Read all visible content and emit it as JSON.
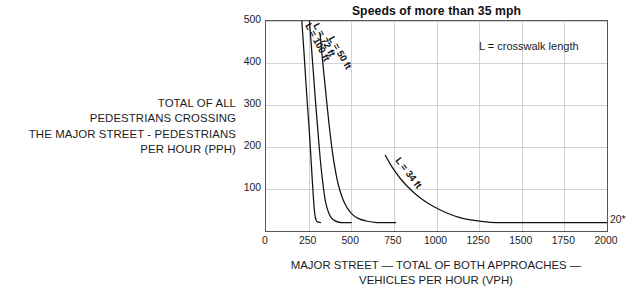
{
  "chart_data": {
    "type": "line",
    "title": "Speeds of more than 35 mph",
    "xlabel_lines": [
      "MAJOR STREET — TOTAL OF BOTH APPROACHES —",
      "VEHICLES PER HOUR (VPH)"
    ],
    "ylabel_lines": [
      "TOTAL OF ALL",
      "PEDESTRIANS CROSSING",
      "THE MAJOR STREET - PEDESTRIANS",
      "PER HOUR (PPH)"
    ],
    "annotation": "L = crosswalk length",
    "floor_annotation": "20*",
    "grid": true,
    "legend_position": "inline-curve-labels",
    "xlim": [
      0,
      2000
    ],
    "ylim": [
      0,
      500
    ],
    "xticks": [
      0,
      250,
      500,
      750,
      1000,
      1250,
      1500,
      1750,
      2000
    ],
    "yticks": [
      100,
      200,
      300,
      400,
      500
    ],
    "line_color": "#111111",
    "grid_color": "#d2d2d2",
    "axis_color": "#575757",
    "floor_value": 20,
    "series": [
      {
        "name": "L = 100 ft",
        "label_angle_deg": 62,
        "label_x": 276,
        "label_y": 500,
        "points": [
          [
            210,
            500
          ],
          [
            222,
            430
          ],
          [
            233,
            360
          ],
          [
            243,
            300
          ],
          [
            252,
            250
          ],
          [
            259,
            205
          ],
          [
            265,
            165
          ],
          [
            270,
            130
          ],
          [
            274,
            105
          ],
          [
            277,
            85
          ],
          [
            280,
            68
          ],
          [
            283,
            52
          ],
          [
            287,
            38
          ],
          [
            292,
            28
          ],
          [
            300,
            22
          ],
          [
            320,
            20
          ]
        ]
      },
      {
        "name": "L = 72 ft",
        "label_angle_deg": 62,
        "label_x": 322,
        "label_y": 500,
        "points": [
          [
            255,
            500
          ],
          [
            268,
            430
          ],
          [
            280,
            365
          ],
          [
            291,
            305
          ],
          [
            301,
            255
          ],
          [
            310,
            210
          ],
          [
            318,
            172
          ],
          [
            326,
            140
          ],
          [
            333,
            115
          ],
          [
            340,
            93
          ],
          [
            347,
            74
          ],
          [
            356,
            58
          ],
          [
            367,
            44
          ],
          [
            382,
            32
          ],
          [
            405,
            24
          ],
          [
            440,
            20
          ],
          [
            500,
            20
          ]
        ]
      },
      {
        "name": "L = 50 ft",
        "label_angle_deg": 60,
        "label_x": 410,
        "label_y": 470,
        "points": [
          [
            317,
            470
          ],
          [
            331,
            410
          ],
          [
            345,
            352
          ],
          [
            358,
            300
          ],
          [
            370,
            253
          ],
          [
            382,
            212
          ],
          [
            394,
            176
          ],
          [
            406,
            146
          ],
          [
            418,
            121
          ],
          [
            431,
            100
          ],
          [
            446,
            81
          ],
          [
            463,
            65
          ],
          [
            483,
            51
          ],
          [
            508,
            39
          ],
          [
            540,
            30
          ],
          [
            585,
            24
          ],
          [
            650,
            20
          ],
          [
            760,
            20
          ]
        ]
      },
      {
        "name": "L = 34 ft",
        "label_angle_deg": 52,
        "label_x": 800,
        "label_y": 180,
        "points": [
          [
            700,
            180
          ],
          [
            728,
            160
          ],
          [
            757,
            142
          ],
          [
            788,
            125
          ],
          [
            820,
            110
          ],
          [
            855,
            96
          ],
          [
            892,
            83
          ],
          [
            932,
            71
          ],
          [
            975,
            60
          ],
          [
            1022,
            50
          ],
          [
            1072,
            41
          ],
          [
            1128,
            33
          ],
          [
            1190,
            27
          ],
          [
            1262,
            23
          ],
          [
            1350,
            20
          ],
          [
            1500,
            20
          ],
          [
            2000,
            20
          ]
        ]
      }
    ]
  }
}
